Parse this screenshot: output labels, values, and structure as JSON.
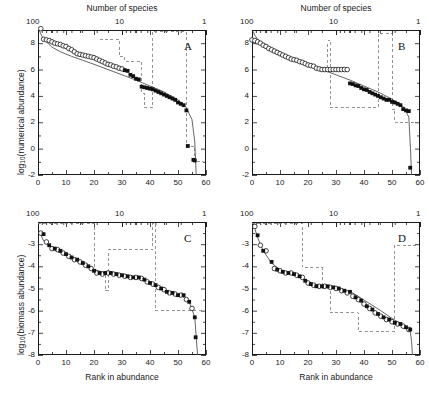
{
  "figure": {
    "top_axis_title": "Number of species",
    "bottom_axis_title": "Rank in abundance",
    "ylabel_top": "log10(numerical abundance)",
    "ylabel_bottom": "log10(biomass abundance)",
    "ylabel_top_prefix": "log",
    "ylabel_top_sub": "10",
    "ylabel_top_suffix": "(numerical abundance)",
    "ylabel_bottom_prefix": "log",
    "ylabel_bottom_sub": "10",
    "ylabel_bottom_suffix": "(biomass abundance)",
    "top_ticks": [
      "100",
      "10",
      "1"
    ],
    "x_ticks": [
      "0",
      "10",
      "20",
      "30",
      "40",
      "50",
      "60"
    ],
    "y_ticks_top": [
      "-2",
      "0",
      "2",
      "4",
      "6",
      "8"
    ],
    "y_ticks_bottom": [
      "-8",
      "-7",
      "-6",
      "-5",
      "-4",
      "-3"
    ],
    "colors": {
      "axis": "#1a1a1a",
      "curve": "#555555",
      "step": "#888888",
      "open_marker": "#222222",
      "filled_marker": "#111111"
    }
  },
  "chart_data": [
    {
      "type": "scatter",
      "panel": "A",
      "title": "A",
      "xlabel": "Rank in abundance",
      "ylabel": "log10(numerical abundance)",
      "top_xlabel": "Number of species",
      "xlim": [
        0,
        60
      ],
      "ylim": [
        -2,
        9
      ],
      "top_xlim": [
        100,
        1
      ],
      "grid": false,
      "series": [
        {
          "name": "open-circles",
          "marker": "open-circle",
          "x": [
            1,
            2,
            3,
            4,
            5,
            6,
            7,
            8,
            9,
            10,
            11,
            12,
            13,
            14,
            15,
            16,
            17,
            18,
            19,
            20,
            21,
            22,
            23,
            24,
            25,
            26,
            27,
            28,
            29,
            30
          ],
          "y": [
            9.1,
            8.3,
            8.25,
            8.2,
            8.1,
            8.0,
            7.95,
            7.9,
            7.8,
            7.75,
            7.6,
            7.5,
            7.35,
            7.2,
            7.15,
            7.1,
            7.05,
            7.0,
            6.95,
            6.9,
            6.8,
            6.7,
            6.6,
            6.5,
            6.4,
            6.35,
            6.25,
            6.2,
            6.1,
            6.05
          ]
        },
        {
          "name": "filled-squares",
          "marker": "filled-square",
          "x": [
            31,
            32,
            33,
            34,
            35,
            36,
            37,
            38,
            39,
            40,
            41,
            42,
            43,
            44,
            45,
            46,
            47,
            48,
            49,
            50,
            51,
            52,
            53,
            53.5,
            55.5,
            56
          ],
          "y": [
            5.95,
            5.9,
            5.6,
            5.5,
            5.3,
            5.25,
            4.7,
            4.65,
            4.6,
            4.55,
            4.5,
            4.4,
            4.3,
            4.2,
            4.1,
            4.0,
            3.9,
            3.8,
            3.7,
            3.5,
            3.4,
            3.3,
            2.9,
            0.2,
            -0.85,
            -0.9
          ]
        }
      ],
      "fit_curve": {
        "name": "fitted-curve",
        "x": [
          0.4,
          1,
          2,
          3,
          5,
          8,
          12,
          16,
          20,
          25,
          30,
          35,
          40,
          45,
          50,
          53,
          55,
          56,
          56.5
        ],
        "y": [
          9.0,
          8.7,
          8.3,
          8.1,
          7.7,
          7.35,
          7.0,
          6.7,
          6.4,
          6.0,
          5.6,
          5.2,
          4.75,
          4.3,
          3.7,
          3.1,
          2.2,
          0.5,
          -2.0
        ]
      },
      "step_curve": {
        "name": "species-step",
        "x": [
          22,
          22,
          29,
          29,
          31,
          31,
          37,
          37,
          38,
          38,
          41,
          41,
          53,
          53,
          56,
          56,
          59
        ],
        "y": [
          8.3,
          8.3,
          8.3,
          7.0,
          7.0,
          6.6,
          6.6,
          4.2,
          4.2,
          3.1,
          3.1,
          8.9,
          8.9,
          0.2,
          0.2,
          -1.0,
          -1.0
        ]
      }
    },
    {
      "type": "scatter",
      "panel": "B",
      "title": "B",
      "xlabel": "Rank in abundance",
      "ylabel": "log10(numerical abundance)",
      "top_xlabel": "Number of species",
      "xlim": [
        0,
        60
      ],
      "ylim": [
        -2,
        9
      ],
      "top_xlim": [
        100,
        1
      ],
      "grid": false,
      "series": [
        {
          "name": "open-circles",
          "marker": "open-circle",
          "x": [
            0,
            1,
            2,
            3,
            4,
            5,
            6,
            7,
            8,
            9,
            10,
            11,
            12,
            13,
            14,
            15,
            16,
            17,
            18,
            19,
            20,
            21,
            22,
            23,
            24,
            25,
            26,
            27,
            28,
            29,
            30,
            31,
            32,
            33,
            34
          ],
          "y": [
            8.25,
            8.2,
            8.1,
            8.0,
            7.85,
            7.75,
            7.6,
            7.5,
            7.4,
            7.3,
            7.2,
            7.1,
            7.0,
            6.9,
            6.8,
            6.75,
            6.7,
            6.6,
            6.55,
            6.45,
            6.35,
            6.3,
            6.25,
            6.1,
            6.05,
            6.0,
            6.0,
            6.0,
            6.0,
            6.0,
            6.0,
            6.0,
            6.0,
            6.0,
            6.0
          ]
        },
        {
          "name": "filled-squares",
          "marker": "filled-square",
          "x": [
            35,
            36,
            37,
            38,
            39,
            40,
            41,
            42,
            43,
            44,
            45,
            46,
            47,
            48,
            49,
            50,
            51,
            52,
            53,
            54,
            55,
            56,
            56.5
          ],
          "y": [
            4.95,
            4.9,
            4.8,
            4.75,
            4.6,
            4.5,
            4.45,
            4.3,
            4.2,
            4.1,
            4.0,
            3.9,
            3.8,
            3.7,
            3.7,
            3.55,
            3.5,
            3.4,
            3.3,
            3.0,
            2.9,
            2.85,
            -1.45
          ]
        }
      ],
      "fit_curve": {
        "name": "fitted-curve",
        "x": [
          0.4,
          1,
          2,
          3,
          5,
          8,
          12,
          16,
          20,
          25,
          30,
          35,
          40,
          45,
          50,
          54,
          56,
          56.6,
          57
        ],
        "y": [
          8.9,
          8.6,
          8.3,
          8.1,
          7.75,
          7.4,
          7.0,
          6.7,
          6.4,
          6.0,
          5.6,
          5.2,
          4.75,
          4.3,
          3.75,
          3.2,
          2.4,
          0.0,
          -2.0
        ]
      },
      "step_curve": {
        "name": "species-step",
        "x": [
          27,
          27,
          28,
          28,
          31,
          31,
          45,
          45,
          50,
          50,
          51,
          51,
          57,
          57,
          59
        ],
        "y": [
          6.1,
          8.2,
          8.2,
          3.1,
          3.1,
          3.1,
          3.1,
          8.7,
          8.7,
          3.0,
          3.0,
          2.0,
          2.0,
          2.0,
          2.0
        ]
      }
    },
    {
      "type": "scatter",
      "panel": "C",
      "title": "C",
      "xlabel": "Rank in abundance",
      "ylabel": "log10(biomass abundance)",
      "top_xlabel": "Number of species",
      "xlim": [
        0,
        60
      ],
      "ylim": [
        -8,
        -2
      ],
      "top_xlim": [
        100,
        1
      ],
      "grid": false,
      "series": [
        {
          "name": "open-circles",
          "marker": "open-circle",
          "x": [
            1,
            3,
            5,
            7,
            9,
            11,
            13,
            15,
            17,
            19,
            21,
            23,
            25,
            27,
            29,
            31,
            33,
            35,
            37,
            39,
            41,
            43,
            45,
            47,
            49,
            51,
            53,
            55
          ],
          "y": [
            -2.5,
            -2.9,
            -3.2,
            -3.25,
            -3.4,
            -3.55,
            -3.7,
            -3.8,
            -3.95,
            -4.1,
            -4.3,
            -4.35,
            -4.3,
            -4.35,
            -4.4,
            -4.45,
            -4.5,
            -4.5,
            -4.55,
            -4.7,
            -4.8,
            -4.95,
            -5.05,
            -5.2,
            -5.25,
            -5.3,
            -5.5,
            -5.9
          ]
        },
        {
          "name": "filled-squares",
          "marker": "filled-square",
          "x": [
            2,
            4,
            6,
            8,
            10,
            12,
            14,
            16,
            18,
            20,
            22,
            24,
            26,
            28,
            30,
            32,
            34,
            36,
            38,
            40,
            42,
            44,
            46,
            48,
            50,
            52,
            54,
            56
          ],
          "y": [
            -2.55,
            -3.05,
            -3.2,
            -3.3,
            -3.45,
            -3.6,
            -3.7,
            -3.85,
            -4.0,
            -4.2,
            -4.3,
            -4.3,
            -4.3,
            -4.35,
            -4.4,
            -4.45,
            -4.5,
            -4.5,
            -4.6,
            -4.75,
            -4.85,
            -5.0,
            -5.15,
            -5.2,
            -5.3,
            -5.3,
            -5.6,
            -6.3
          ]
        },
        {
          "name": "outlier",
          "marker": "filled-square",
          "x": [
            56.3
          ],
          "y": [
            -7.2
          ]
        }
      ],
      "fit_curve": {
        "name": "fitted-curve",
        "x": [
          0.5,
          2,
          5,
          9,
          14,
          19,
          24,
          30,
          36,
          42,
          47,
          51,
          54,
          56,
          56.5,
          57
        ],
        "y": [
          -2.45,
          -2.85,
          -3.2,
          -3.45,
          -3.75,
          -4.1,
          -4.3,
          -4.4,
          -4.5,
          -4.85,
          -5.15,
          -5.3,
          -5.6,
          -6.3,
          -7.2,
          -8.0
        ]
      },
      "step_curve": {
        "name": "species-step",
        "x": [
          0,
          0,
          20,
          20,
          24,
          24,
          25,
          25,
          41,
          41,
          42,
          42,
          59
        ],
        "y": [
          -2.05,
          -2.05,
          -2.05,
          -4.3,
          -4.3,
          -5.1,
          -5.1,
          -3.25,
          -3.25,
          -2.05,
          -2.05,
          -6.0,
          -6.0
        ]
      }
    },
    {
      "type": "scatter",
      "panel": "D",
      "title": "D",
      "xlabel": "Rank in abundance",
      "ylabel": "log10(biomass abundance)",
      "top_xlabel": "Number of species",
      "xlim": [
        0,
        60
      ],
      "ylim": [
        -8,
        -2
      ],
      "top_xlim": [
        100,
        1
      ],
      "grid": false,
      "series": [
        {
          "name": "open-circles",
          "marker": "open-circle",
          "x": [
            1,
            3,
            5,
            8,
            10,
            12,
            14,
            16,
            18,
            20,
            22,
            24,
            26,
            28,
            30,
            32,
            34,
            36,
            38,
            40,
            42,
            44,
            46,
            48,
            50,
            52,
            54,
            56
          ],
          "y": [
            -2.2,
            -3.05,
            -3.3,
            -4.1,
            -4.2,
            -4.3,
            -4.3,
            -4.4,
            -4.5,
            -4.75,
            -4.85,
            -4.9,
            -4.9,
            -4.95,
            -5.0,
            -5.1,
            -5.2,
            -5.35,
            -5.5,
            -5.7,
            -5.9,
            -6.1,
            -6.25,
            -6.4,
            -6.5,
            -6.6,
            -6.7,
            -6.85
          ]
        },
        {
          "name": "filled-squares",
          "marker": "filled-square",
          "x": [
            2,
            4,
            7,
            9,
            11,
            13,
            15,
            17,
            19,
            21,
            23,
            25,
            27,
            29,
            31,
            33,
            35,
            37,
            39,
            41,
            43,
            45,
            47,
            49,
            51,
            53,
            55,
            56.5
          ],
          "y": [
            -2.6,
            -3.3,
            -3.8,
            -4.15,
            -4.25,
            -4.3,
            -4.35,
            -4.45,
            -4.65,
            -4.8,
            -4.9,
            -4.9,
            -4.9,
            -4.95,
            -5.0,
            -5.1,
            -5.15,
            -5.4,
            -5.55,
            -5.8,
            -5.95,
            -6.15,
            -6.3,
            -6.4,
            -6.55,
            -6.6,
            -6.75,
            -6.85
          ]
        }
      ],
      "fit_curve": {
        "name": "fitted-curve",
        "x": [
          0.5,
          2,
          4,
          7,
          10,
          14,
          18,
          22,
          27,
          31,
          36,
          41,
          46,
          50,
          54,
          56.5,
          57,
          57.3
        ],
        "y": [
          -2.1,
          -2.7,
          -3.3,
          -3.85,
          -4.15,
          -4.35,
          -4.55,
          -4.8,
          -4.9,
          -5.0,
          -5.2,
          -5.6,
          -6.0,
          -6.35,
          -6.65,
          -6.9,
          -7.4,
          -8.0
        ]
      },
      "step_curve": {
        "name": "species-step",
        "x": [
          0,
          0,
          18,
          18,
          25,
          25,
          28,
          28,
          38,
          38,
          51,
          51,
          59
        ],
        "y": [
          -2.05,
          -2.05,
          -2.05,
          -4.05,
          -4.05,
          -5.0,
          -5.0,
          -6.1,
          -6.1,
          -6.95,
          -6.95,
          -3.05,
          -3.05
        ]
      }
    }
  ]
}
